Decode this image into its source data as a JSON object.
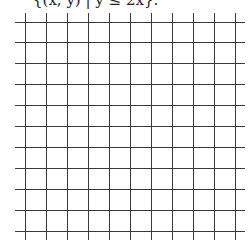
{
  "caption": {
    "text": "{(x, y) | y ≤ 2x}."
  },
  "grid": {
    "line_color": "#3a3a3a",
    "background": "#ffffff",
    "vertical_lines_x": [
      25,
      46,
      67,
      88,
      109,
      130,
      151,
      172,
      193,
      214,
      235
    ],
    "horizontal_lines_y": [
      22,
      42,
      63,
      84,
      105,
      126,
      147,
      168,
      189,
      210,
      231
    ],
    "vertical_extent": [
      13,
      240
    ],
    "horizontal_extent": [
      15,
      245
    ],
    "columns": 11,
    "rows": 11
  }
}
